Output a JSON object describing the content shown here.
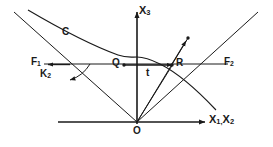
{
  "figure": {
    "type": "geometry-diagram",
    "stroke_color": "#1a1a1a",
    "background_color": "#ffffff"
  },
  "labels": {
    "axis_vertical": "X",
    "axis_vertical_sub": "3",
    "axis_horizontal_1": "X",
    "axis_horizontal_1_sub": "1,",
    "axis_horizontal_2": "X",
    "axis_horizontal_2_sub": "2",
    "curve": "C",
    "focus_left": "F",
    "focus_left_sub": "1",
    "focus_right": "F",
    "focus_right_sub": "2",
    "k_label": "K",
    "k_label_sub": "2",
    "point_q": "Q",
    "point_r": "R",
    "segment_t": "t",
    "origin": "O"
  },
  "geometry": {
    "origin_px": [
      137,
      122
    ],
    "vertex_px": [
      137,
      57
    ],
    "q_px": [
      120,
      65
    ],
    "r_px": [
      175,
      65
    ],
    "f1_px": [
      48,
      64
    ],
    "f2_px": [
      220,
      64
    ],
    "curve_point_px": [
      188,
      38
    ],
    "horizontal_axis_y": 122,
    "vertical_axis_x": 137,
    "chord_line_y": 64
  }
}
